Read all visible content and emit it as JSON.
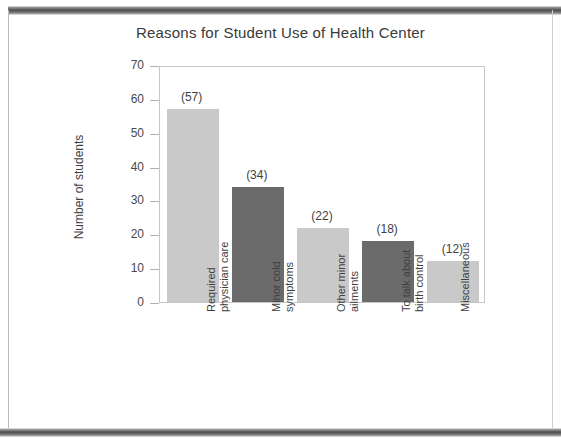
{
  "chart_data": {
    "type": "bar",
    "title": "Reasons for Student Use of Health Center",
    "xlabel": "",
    "ylabel": "Number of students",
    "ylim": [
      0,
      70
    ],
    "yticks": [
      0,
      10,
      20,
      30,
      40,
      50,
      60,
      70
    ],
    "grid": false,
    "legend": null,
    "categories": [
      "Required physician care",
      "Minor cold symptoms",
      "Other minor ailments",
      "To talk about birth control",
      "Miscellaneous"
    ],
    "category_lines": [
      [
        "Required",
        "physician care"
      ],
      [
        "Minor cold",
        "symptoms"
      ],
      [
        "Other minor",
        "ailments"
      ],
      [
        "To talk about",
        "birth control"
      ],
      [
        "Miscellaneous",
        ""
      ]
    ],
    "values": [
      57,
      34,
      22,
      18,
      12
    ],
    "data_labels": [
      "(57)",
      "(34)",
      "(22)",
      "(18)",
      "(12)"
    ],
    "bar_colors": [
      "#c9c9c9",
      "#6b6b6b",
      "#c9c9c9",
      "#6b6b6b",
      "#c9c9c9"
    ]
  },
  "colors": {
    "bar_light": "#c9c9c9",
    "bar_dark": "#6b6b6b",
    "axis": "#c6c6c6",
    "text": "#3f3f3f",
    "band": "#4a4a4a"
  }
}
